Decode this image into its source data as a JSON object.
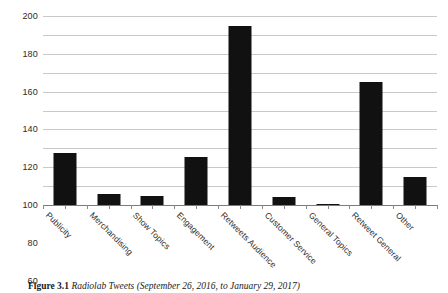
{
  "figure": {
    "caption_label": "Figure 3.1",
    "caption_text": "Radiolab Tweets (September 26, 2016, to January 29, 2017)"
  },
  "chart_data": {
    "type": "bar",
    "title": "",
    "xlabel": "",
    "ylabel": "",
    "ylim": [
      0,
      200
    ],
    "ytick_step": 20,
    "grid": true,
    "legend": "none",
    "bar_color": "#111111",
    "gridline_color": "#c9c9c9",
    "axis_color": "#7a7a7a",
    "categories": [
      "Publicity",
      "Merchandising",
      "Show Topics",
      "Engagement",
      "Retweets Audience",
      "Customer Service",
      "General Topics",
      "Retweet General",
      "Other"
    ],
    "values": [
      55,
      12,
      10,
      51,
      189,
      9,
      1,
      130,
      30
    ],
    "yticks": [
      0,
      20,
      40,
      60,
      80,
      100,
      120,
      140,
      160,
      180,
      200
    ]
  }
}
